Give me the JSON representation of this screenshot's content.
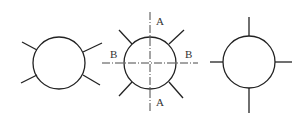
{
  "figures": [
    {
      "id": "left",
      "description": "circle with four diagonal leads"
    },
    {
      "id": "middle",
      "description": "circle with four diagonal leads and dash-dot section lines"
    },
    {
      "id": "right",
      "description": "circle with four orthogonal leads"
    }
  ],
  "labels": {
    "a_top": "A",
    "a_bottom": "A",
    "b_left": "B",
    "b_right": "B"
  },
  "colors": {
    "stroke": "#222222",
    "background": "#ffffff"
  }
}
